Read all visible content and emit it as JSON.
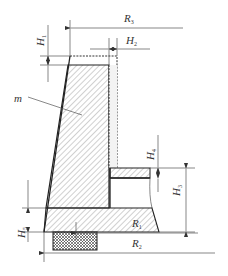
{
  "diagram": {
    "type": "engineering cross-section with dimension annotations",
    "labels": {
      "R3": {
        "main": "R",
        "sub": "3"
      },
      "R1": {
        "main": "R",
        "sub": "1"
      },
      "R2": {
        "main": "R",
        "sub": "2"
      },
      "H1": {
        "main": "H",
        "sub": "1"
      },
      "H2": {
        "main": "H",
        "sub": "2"
      },
      "H3": {
        "main": "H",
        "sub": "3"
      },
      "H4": {
        "main": "H",
        "sub": "4"
      },
      "H5": {
        "main": "H",
        "sub": "5"
      },
      "m": {
        "main": "m"
      }
    },
    "colors": {
      "line": "#222222",
      "dimension_line": "#555555",
      "hatch": "#666666",
      "background": "#ffffff"
    }
  }
}
